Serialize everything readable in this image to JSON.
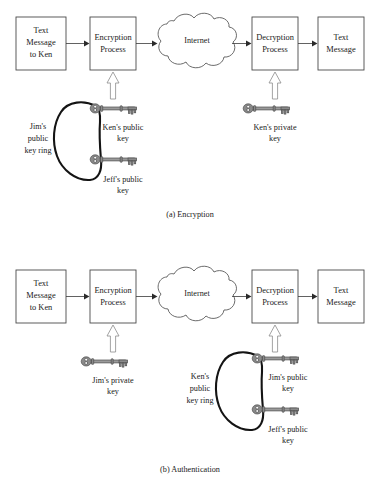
{
  "figure": {
    "type": "diagram",
    "background_color": "#ffffff",
    "text_color": "#1a1a1a",
    "box_stroke_color": "#4a4a4a",
    "key_ring_color": "#141414",
    "key_fill_color": "#8a8a8a",
    "arrow_color": "#2a2a2a",
    "hollow_arrow_stroke": "#8c8c8c"
  },
  "panel_a": {
    "caption": "(a) Encryption",
    "boxes": {
      "source": "Text\nMessage\nto Ken",
      "source_lines": [
        "Text",
        "Message",
        "to Ken"
      ],
      "process_left": "Encryption\nProcess",
      "process_left_lines": [
        "Encryption",
        "Process"
      ],
      "cloud": "Internet",
      "process_right": "Decryption\nProcess",
      "process_right_lines": [
        "Decryption",
        "Process"
      ],
      "sink": "Text\nMessage",
      "sink_lines": [
        "Text",
        "Message"
      ]
    },
    "key_ring_label_lines": [
      "Jim's",
      "public",
      "key ring"
    ],
    "keys": [
      {
        "label_lines": [
          "Ken's public",
          "key"
        ],
        "on_ring": true
      },
      {
        "label_lines": [
          "Jeff's public",
          "key"
        ],
        "on_ring": true
      },
      {
        "label_lines": [
          "Ken's private",
          "key"
        ],
        "on_ring": false
      }
    ]
  },
  "panel_b": {
    "caption": "(b) Authentication",
    "boxes": {
      "source": "Text\nMessage\nto Ken",
      "source_lines": [
        "Text",
        "Message",
        "to Ken"
      ],
      "process_left": "Encryption\nProcess",
      "process_left_lines": [
        "Encryption",
        "Process"
      ],
      "cloud": "Internet",
      "process_right": "Decryption\nProcess",
      "process_right_lines": [
        "Decryption",
        "Process"
      ],
      "sink": "Text\nMessage",
      "sink_lines": [
        "Text",
        "Message"
      ]
    },
    "key_ring_label_lines": [
      "Ken's",
      "public",
      "key ring"
    ],
    "keys": [
      {
        "label_lines": [
          "Jim's private",
          "key"
        ],
        "on_ring": false
      },
      {
        "label_lines": [
          "Jim's public",
          "key"
        ],
        "on_ring": true
      },
      {
        "label_lines": [
          "Jeff's public",
          "key"
        ],
        "on_ring": true
      }
    ]
  }
}
